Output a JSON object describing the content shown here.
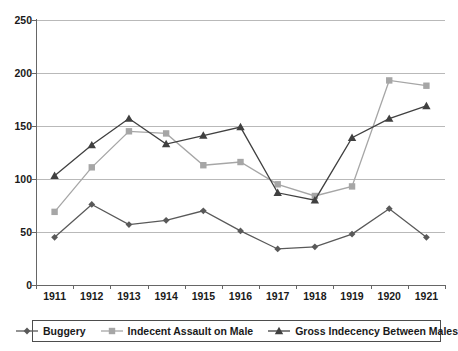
{
  "chart_data": {
    "type": "line",
    "title": "",
    "xlabel": "",
    "ylabel": "",
    "categories": [
      "1911",
      "1912",
      "1913",
      "1914",
      "1915",
      "1916",
      "1917",
      "1918",
      "1919",
      "1920",
      "1921"
    ],
    "ylim": [
      0,
      250
    ],
    "yticks": [
      0,
      50,
      100,
      150,
      200,
      250
    ],
    "ytick_labels": [
      "0",
      "50",
      "100",
      "150",
      "200",
      "250"
    ],
    "grid": true,
    "legend_position": "bottom",
    "series": [
      {
        "name": "Buggery",
        "color": "#595959",
        "marker": "diamond",
        "values": [
          45,
          76,
          57,
          61,
          70,
          51,
          34,
          36,
          48,
          72,
          45
        ]
      },
      {
        "name": "Indecent Assault on Male",
        "color": "#a6a6a6",
        "marker": "square",
        "values": [
          69,
          111,
          145,
          143,
          113,
          116,
          95,
          84,
          93,
          193,
          188
        ]
      },
      {
        "name": "Gross Indecency Between Males",
        "color": "#404040",
        "marker": "triangle",
        "values": [
          103,
          132,
          157,
          133,
          141,
          149,
          87,
          80,
          139,
          157,
          169
        ]
      }
    ]
  },
  "legend": {
    "items": [
      {
        "label": "Buggery",
        "marker": "diamond-marker",
        "color": "#595959"
      },
      {
        "label": "Indecent Assault on Male",
        "marker": "square-marker",
        "color": "#a6a6a6"
      },
      {
        "label": "Gross Indecency Between Males",
        "marker": "triangle-marker",
        "color": "#404040"
      }
    ]
  }
}
